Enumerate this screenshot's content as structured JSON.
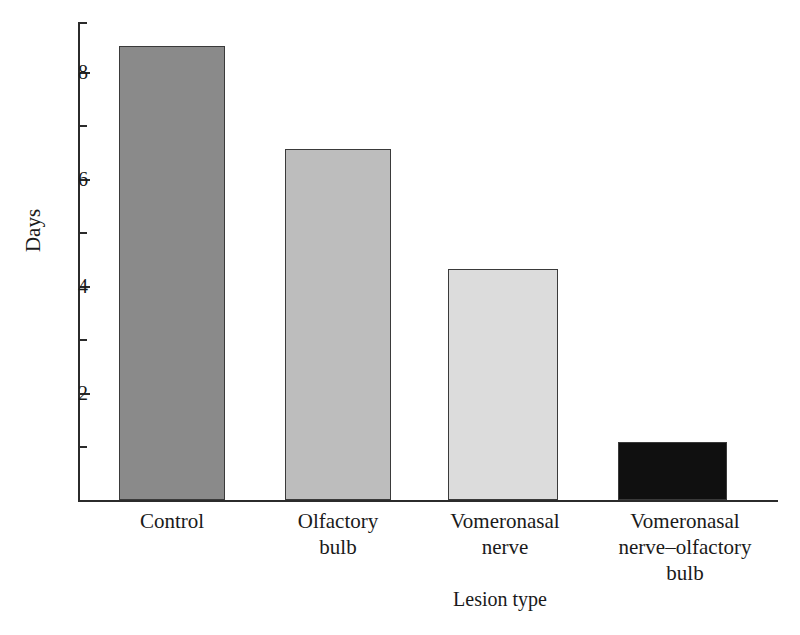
{
  "chart_data": {
    "type": "bar",
    "title": "",
    "xlabel": "Lesion type",
    "ylabel": "Days",
    "categories": [
      "Control",
      "Olfactory bulb",
      "Vomeronasal nerve",
      "Vomeronasal nerve–olfactory bulb"
    ],
    "values": [
      8.55,
      6.6,
      4.35,
      1.1
    ],
    "bar_colors": [
      "#8a8a8a",
      "#bdbdbd",
      "#dcdcdc",
      "#101010"
    ],
    "bar_edge_color": "#3a3a3a",
    "ylim": [
      0,
      9
    ],
    "y_major_ticks": [
      2,
      4,
      6,
      8
    ],
    "y_minor_ticks": [
      1,
      3,
      5,
      7,
      9
    ],
    "y_tick_labels": [
      "8",
      "6",
      "4",
      "2"
    ],
    "grid": false,
    "legend": "none",
    "axis_color": "#2b2b2b",
    "background": "#ffffff"
  },
  "axis": {
    "y_title": "Days",
    "x_title": "Lesion type"
  },
  "category_label_lines": [
    [
      "Control"
    ],
    [
      "Olfactory",
      "bulb"
    ],
    [
      "Vomeronasal",
      "nerve"
    ],
    [
      "Vomeronasal",
      "nerve–olfactory",
      "bulb"
    ]
  ]
}
